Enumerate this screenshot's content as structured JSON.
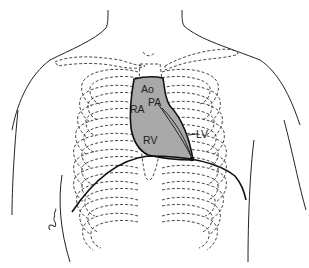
{
  "figure": {
    "labels": {
      "ao": "Ao",
      "pa": "PA",
      "ra": "RA",
      "rv": "RV",
      "lv": "LV"
    },
    "colors": {
      "heart_fill": "#a9a9a9",
      "line": "#222222",
      "background": "#ffffff"
    },
    "signature": "artist-signature"
  }
}
